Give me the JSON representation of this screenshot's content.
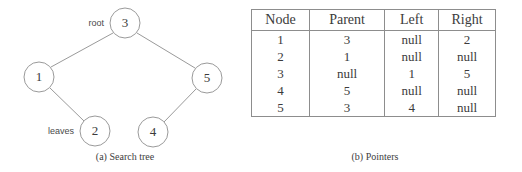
{
  "figure": {
    "background": "#ffffff",
    "line_color": "#9a9a9a",
    "text_color": "#3b3b3b",
    "rule_color": "#8d8d8d"
  },
  "tree": {
    "caption": "(a)  Search tree",
    "annotations": {
      "root_label": "root",
      "leaves_label": "leaves"
    },
    "nodes": [
      {
        "id": "3",
        "label": "3",
        "cx": 125,
        "cy": 23,
        "r": 15
      },
      {
        "id": "1",
        "label": "1",
        "cx": 39,
        "cy": 77,
        "r": 15
      },
      {
        "id": "5",
        "label": "5",
        "cx": 207,
        "cy": 78,
        "r": 15
      },
      {
        "id": "2",
        "label": "2",
        "cx": 95,
        "cy": 131,
        "r": 15
      },
      {
        "id": "4",
        "label": "4",
        "cx": 153,
        "cy": 132,
        "r": 15
      }
    ],
    "edges": [
      {
        "from": "3",
        "to": "1",
        "x1": 113,
        "y1": 33,
        "x2": 51,
        "y2": 67
      },
      {
        "from": "3",
        "to": "5",
        "x1": 137,
        "y1": 33,
        "x2": 195,
        "y2": 68
      },
      {
        "from": "1",
        "to": "2",
        "x1": 50,
        "y1": 88,
        "x2": 84,
        "y2": 121
      },
      {
        "from": "5",
        "to": "4",
        "x1": 196,
        "y1": 89,
        "x2": 164,
        "y2": 122
      }
    ]
  },
  "pointers": {
    "caption": "(b)  Pointers",
    "columns": [
      "Node",
      "Parent",
      "Left",
      "Right"
    ],
    "rows": [
      {
        "node": "1",
        "parent": "3",
        "left": "null",
        "right": "2"
      },
      {
        "node": "2",
        "parent": "1",
        "left": "null",
        "right": "null"
      },
      {
        "node": "3",
        "parent": "null",
        "left": "1",
        "right": "5"
      },
      {
        "node": "4",
        "parent": "5",
        "left": "null",
        "right": "null"
      },
      {
        "node": "5",
        "parent": "3",
        "left": "4",
        "right": "null"
      }
    ]
  }
}
